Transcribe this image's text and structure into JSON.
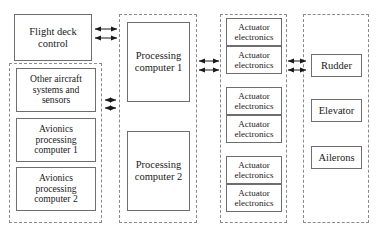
{
  "diagram": {
    "background_color": "#ffffff",
    "solid_border_color": "#6e6e6e",
    "dashed_border_color": "#8a8a8a",
    "arrow_color": "#1a1a1a"
  },
  "column1": {
    "flight_deck_control": "Flight deck\ncontrol",
    "flight_deck_control_lines": [
      "Flight deck",
      "control"
    ],
    "group_items": [
      {
        "lines": [
          "Other aircraft",
          "systems and",
          "sensors"
        ]
      },
      {
        "lines": [
          "Avionics",
          "processing",
          "computer 1"
        ]
      },
      {
        "lines": [
          "Avionics",
          "processing",
          "computer 2"
        ]
      }
    ]
  },
  "column2": {
    "group_items": [
      {
        "lines": [
          "Processing",
          "computer 1"
        ]
      },
      {
        "lines": [
          "Processing",
          "computer 2"
        ]
      }
    ]
  },
  "column3": {
    "group_items": [
      {
        "lines": [
          "Actuator",
          "electronics"
        ]
      },
      {
        "lines": [
          "Actuator",
          "electronics"
        ]
      },
      {
        "lines": [
          "Actuator",
          "electronics"
        ]
      },
      {
        "lines": [
          "Actuator",
          "electronics"
        ]
      },
      {
        "lines": [
          "Actuator",
          "electronics"
        ]
      },
      {
        "lines": [
          "Actuator",
          "electronics"
        ]
      }
    ]
  },
  "column4": {
    "group_items": [
      {
        "lines": [
          "Rudder"
        ]
      },
      {
        "lines": [
          "Elevator"
        ]
      },
      {
        "lines": [
          "Ailerons"
        ]
      }
    ]
  },
  "connectors": [
    {
      "name": "flight-deck-to-processing-upper",
      "style": "double-headed"
    },
    {
      "name": "flight-deck-to-processing-lower",
      "style": "double-headed"
    },
    {
      "name": "avionics-group-to-processing-upper",
      "style": "double-headed-short"
    },
    {
      "name": "avionics-group-to-processing-lower",
      "style": "double-headed-short"
    },
    {
      "name": "processing-to-actuator-upper",
      "style": "double-headed"
    },
    {
      "name": "processing-to-actuator-lower",
      "style": "double-headed"
    },
    {
      "name": "actuator-to-surface-upper",
      "style": "double-headed"
    },
    {
      "name": "actuator-to-surface-lower",
      "style": "double-headed"
    }
  ]
}
